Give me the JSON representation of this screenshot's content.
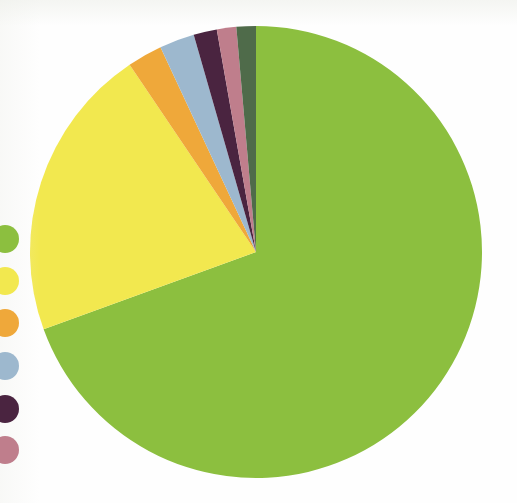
{
  "page": {
    "background": "#fefefe",
    "width": 517,
    "height": 503
  },
  "chart_data": {
    "type": "pie",
    "title": "",
    "subtitle": "",
    "xlabel": "",
    "ylabel": "",
    "grid": false,
    "legend_position": "left",
    "start_angle_deg": 0,
    "direction": "clockwise",
    "center": {
      "x": 256,
      "y": 252
    },
    "radius": 226,
    "labels": [
      "Series 1",
      "Series 2",
      "Series 3",
      "Series 4",
      "Series 5",
      "Series 6",
      "Series 7"
    ],
    "values": [
      69.4,
      21.1,
      2.5,
      2.5,
      1.7,
      1.4,
      1.4
    ],
    "percent_labels": [
      "69.4%",
      "21.1%",
      "2.5%",
      "2.5%",
      "1.7%",
      "1.4%",
      "1.4%"
    ],
    "colors": [
      "#8cbf3f",
      "#f2e84f",
      "#efa83a",
      "#9db8ce",
      "#4a2440",
      "#bf7e8c",
      "#4f6b4a"
    ],
    "slices": [
      {
        "label": "Series 1",
        "value": 69.4,
        "color": "#8cbf3f",
        "start_deg": 0.0,
        "end_deg": 250.0
      },
      {
        "label": "Series 2",
        "value": 21.1,
        "color": "#f2e84f",
        "start_deg": 250.0,
        "end_deg": 326.0
      },
      {
        "label": "Series 3",
        "value": 2.5,
        "color": "#efa83a",
        "start_deg": 326.0,
        "end_deg": 335.0
      },
      {
        "label": "Series 4",
        "value": 2.5,
        "color": "#9db8ce",
        "start_deg": 335.0,
        "end_deg": 344.0
      },
      {
        "label": "Series 5",
        "value": 1.7,
        "color": "#4a2440",
        "start_deg": 344.0,
        "end_deg": 350.0
      },
      {
        "label": "Series 6",
        "value": 1.4,
        "color": "#bf7e8c",
        "start_deg": 350.0,
        "end_deg": 355.0
      },
      {
        "label": "Series 7",
        "value": 1.4,
        "color": "#4f6b4a",
        "start_deg": 355.0,
        "end_deg": 360.0
      }
    ]
  },
  "legend": {
    "position": "left",
    "clipped_left": true,
    "items": [
      {
        "marker": "legend-dot",
        "color": "#8cbf3f",
        "y": 239,
        "label": ""
      },
      {
        "marker": "legend-dot",
        "color": "#f2e84f",
        "y": 281,
        "label": ""
      },
      {
        "marker": "legend-dot",
        "color": "#efa83a",
        "y": 323,
        "label": ""
      },
      {
        "marker": "legend-dot",
        "color": "#9db8ce",
        "y": 366,
        "label": ""
      },
      {
        "marker": "legend-dot",
        "color": "#4a2440",
        "y": 409,
        "label": ""
      },
      {
        "marker": "legend-dot",
        "color": "#bf7e8c",
        "y": 450,
        "label": ""
      }
    ]
  }
}
